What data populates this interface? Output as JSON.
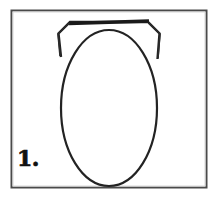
{
  "figure": {
    "label": "1.",
    "caption": "",
    "colors": {
      "background": "#ffffff",
      "ink": "#2b2b2b",
      "ink_dark": "#111111",
      "frame": "#4a4a4a"
    },
    "frame": {
      "name": "panel-border",
      "x": 11,
      "y": 10,
      "width": 196,
      "height": 178,
      "stroke_width": 2
    },
    "shapes": [
      {
        "name": "oval-body",
        "type": "ellipse",
        "cx": 109,
        "cy": 108,
        "rx": 48,
        "ry": 78,
        "stroke_width": 2.2,
        "fill": "none"
      },
      {
        "name": "angular-cap-outline",
        "type": "polyline",
        "points": "61,56 59,33 70,22 148,22 159,33 157,58",
        "stroke_width": 2.4,
        "fill": "none"
      },
      {
        "name": "top-bar-stroke",
        "type": "line",
        "x1": 69,
        "y1": 23,
        "x2": 149,
        "y2": 21,
        "stroke_width": 3.6
      }
    ]
  }
}
